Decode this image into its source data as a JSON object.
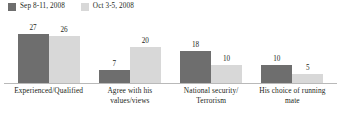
{
  "chart_data": {
    "type": "bar",
    "title": "",
    "subtitle": "",
    "xlabel": "",
    "ylabel": "",
    "grid": false,
    "legend_position": "top-left",
    "ylim": [
      0,
      30
    ],
    "categories": [
      "Experienced/Qualified",
      "Agree with his values/views",
      "National security/ Terrorism",
      "His choice of running mate"
    ],
    "category_lines": [
      [
        "Experienced/Qualified"
      ],
      [
        "Agree with his",
        "values/views"
      ],
      [
        "National security/",
        "Terrorism"
      ],
      [
        "His choice of running",
        "mate"
      ]
    ],
    "series": [
      {
        "name": "Sep 8-11, 2008",
        "color": "#6e6e6e",
        "values": [
          27,
          7,
          18,
          10
        ]
      },
      {
        "name": "Oct 3-5, 2008",
        "color": "#d8d8d8",
        "values": [
          26,
          20,
          10,
          5
        ]
      }
    ]
  },
  "legend": {
    "items": [
      {
        "label": "Sep 8-11, 2008",
        "color": "#6e6e6e"
      },
      {
        "label": "Oct 3-5, 2008",
        "color": "#d8d8d8"
      }
    ]
  },
  "colors": {
    "series_dark": "#6e6e6e",
    "series_light": "#d8d8d8",
    "axis": "#b9b9b9",
    "text": "#231f20",
    "background": "#ffffff"
  }
}
